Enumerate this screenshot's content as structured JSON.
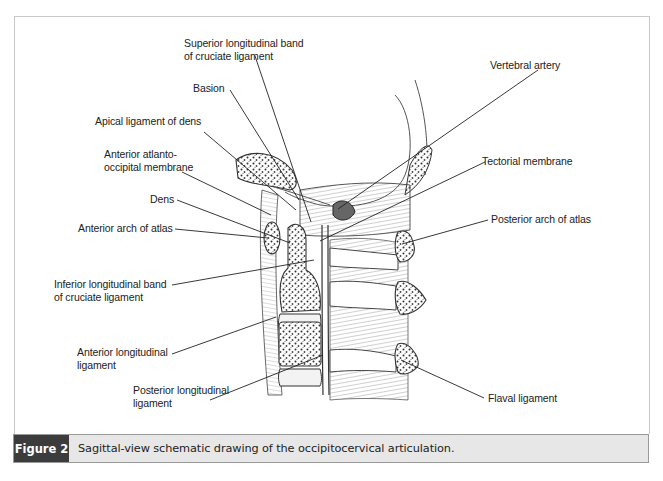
{
  "figure": {
    "number_label": "Figure 2",
    "caption": "Sagittal-view schematic drawing of the occipitocervical articulation."
  },
  "labels": {
    "superior_band": [
      "Superior longitudinal band",
      "of cruciate ligament"
    ],
    "vertebral_artery": "Vertebral artery",
    "basion": "Basion",
    "apical_ligament": "Apical ligament of dens",
    "anterior_atlanto": [
      "Anterior atlanto-",
      "occipital membrane"
    ],
    "tectorial_membrane": "Tectorial membrane",
    "dens": "Dens",
    "anterior_arch": "Anterior arch of atlas",
    "posterior_arch": "Posterior arch of atlas",
    "inferior_band": [
      "Inferior longitudinal band",
      "of cruciate ligament"
    ],
    "anterior_longitudinal": [
      "Anterior longitudinal",
      "ligament"
    ],
    "posterior_longitudinal": [
      "Posterior longitudinal",
      "ligament"
    ],
    "flaval_ligament": "Flaval ligament"
  },
  "colors": {
    "caption_tag_bg": "#3c3c3c",
    "caption_bar_bg": "#e7e7e7",
    "frame_border": "#c8c8c8",
    "line": "#222222"
  }
}
